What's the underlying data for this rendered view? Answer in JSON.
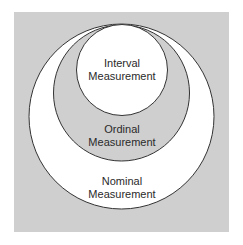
{
  "diagram": {
    "colors": {
      "background": "#cfcfcf",
      "nominal_fill": "#ffffff",
      "ordinal_fill": "#cfcfcf",
      "interval_fill": "#ffffff",
      "stroke": "#333333"
    },
    "circles": [
      {
        "id": "nominal",
        "label_line1": "Nominal",
        "label_line2": "Measurement"
      },
      {
        "id": "ordinal",
        "label_line1": "Ordinal",
        "label_line2": "Measurement"
      },
      {
        "id": "interval",
        "label_line1": "Interval",
        "label_line2": "Measurement"
      }
    ]
  }
}
